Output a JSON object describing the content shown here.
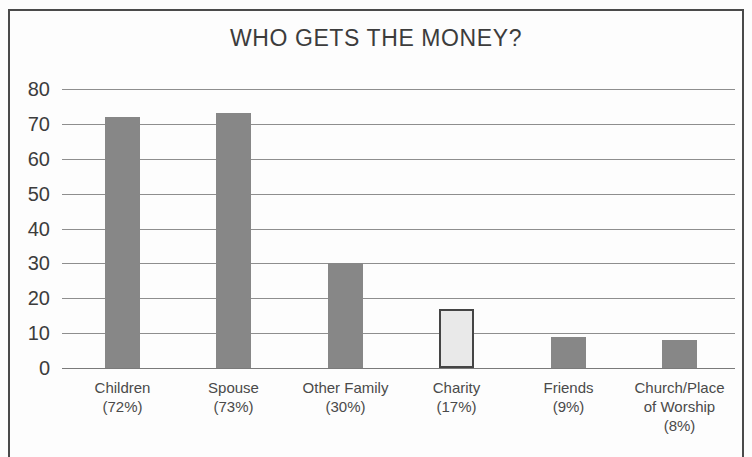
{
  "chart_data": {
    "type": "bar",
    "title": "WHO GETS THE MONEY?",
    "xlabel": "",
    "ylabel": "",
    "ylim": [
      0,
      80
    ],
    "ytick_step": 10,
    "yticks": [
      "80",
      "70",
      "60",
      "50",
      "40",
      "30",
      "20",
      "10",
      "0"
    ],
    "grid": true,
    "legend": "none",
    "categories": [
      "Children",
      "Spouse",
      "Other Family",
      "Charity",
      "Friends",
      "Church/Place of Worship"
    ],
    "category_lines": [
      [
        "Children"
      ],
      [
        "Spouse"
      ],
      [
        "Other Family"
      ],
      [
        "Charity"
      ],
      [
        "Friends"
      ],
      [
        "Church/Place",
        "of Worship"
      ]
    ],
    "percent_labels": [
      "(72%)",
      "(73%)",
      "(30%)",
      "(17%)",
      "(9%)",
      "(8%)"
    ],
    "values": [
      72,
      73,
      30,
      17,
      9,
      8
    ],
    "bar_styles": [
      "dark",
      "dark",
      "dark",
      "light",
      "dark",
      "dark"
    ],
    "colors": {
      "bar_dark": "#878787",
      "bar_light_fill": "#e9e9e9",
      "bar_light_border": "#454545",
      "gridline": "#8e8e8e",
      "text": "#3c3c3c",
      "background": "#fdfdfd",
      "frame": "#4a4a4a"
    }
  },
  "bars": [
    {
      "label": "Children",
      "pct": "(72%)",
      "value": 72,
      "style": "dark",
      "left": 43,
      "width": 35
    },
    {
      "label": "Spouse",
      "pct": "(73%)",
      "value": 73,
      "style": "dark",
      "left": 154,
      "width": 35
    },
    {
      "label": "Other Family",
      "pct": "(30%)",
      "value": 30,
      "style": "dark",
      "left": 266,
      "width": 35
    },
    {
      "label": "Charity",
      "pct": "(17%)",
      "value": 17,
      "style": "light",
      "left": 377,
      "width": 35
    },
    {
      "label": "Friends",
      "pct": "(9%)",
      "value": 9,
      "style": "dark",
      "left": 489,
      "width": 35
    },
    {
      "label": "Church/Place of Worship",
      "pct": "(8%)",
      "value": 8,
      "style": "dark",
      "left": 600,
      "width": 35
    }
  ]
}
